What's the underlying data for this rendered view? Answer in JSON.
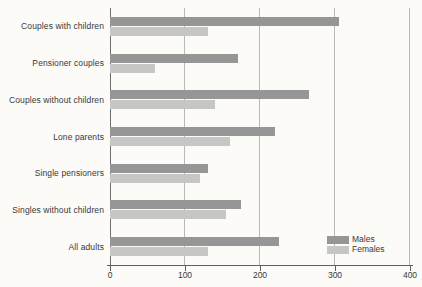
{
  "chart_data": {
    "type": "bar",
    "orientation": "horizontal",
    "title": "",
    "xlabel": "",
    "ylabel": "",
    "categories": [
      "Couples with children",
      "Pensioner couples",
      "Couples without children",
      "Lone parents",
      "Single pensioners",
      "Singles without children",
      "All adults"
    ],
    "series": [
      {
        "name": "Males",
        "color": "#969696",
        "values": [
          305,
          170,
          265,
          220,
          130,
          175,
          225
        ]
      },
      {
        "name": "Females",
        "color": "#c6c6c5",
        "values": [
          130,
          60,
          140,
          160,
          120,
          155,
          130
        ]
      }
    ],
    "xlim": [
      0,
      400
    ],
    "xticks": [
      0,
      100,
      200,
      300,
      400
    ],
    "grid": true,
    "legend_position": "inside-bottom-right"
  },
  "colors": {
    "background": "#fcfbf8",
    "axis": "#5f5f5f",
    "gridline": "#b9b9b6",
    "text": "#383838",
    "males_bar": "#969696",
    "females_bar": "#c6c6c5"
  }
}
